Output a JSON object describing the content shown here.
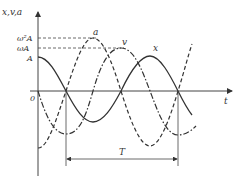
{
  "diagram": {
    "axis_y_label": "x,v,a",
    "axis_x_label": "t",
    "origin_label": "0",
    "level_labels": [
      "ω²A",
      "ωA",
      "A"
    ],
    "curve_labels": {
      "a": "a",
      "v": "v",
      "x": "x"
    },
    "period_label": "T",
    "line_color": "#333333"
  },
  "curves": [
    {
      "name": "x",
      "style": "solid",
      "amplitude": "A",
      "phase": "cos"
    },
    {
      "name": "v",
      "style": "dash-dot",
      "amplitude": "ωA",
      "phase": "-sin"
    },
    {
      "name": "a",
      "style": "dashed",
      "amplitude": "ω²A",
      "phase": "-cos"
    }
  ]
}
